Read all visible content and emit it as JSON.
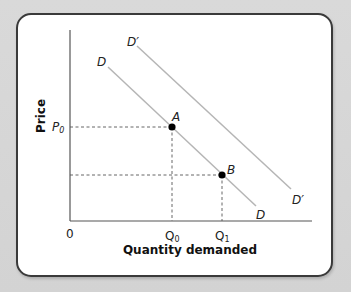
{
  "diagram": {
    "type": "economics-demand-shift",
    "axes": {
      "x_title": "Quantity demanded",
      "y_title": "Price",
      "origin_label": "0"
    },
    "curves": [
      {
        "name": "D",
        "label_start": "D",
        "label_end": "D",
        "color": "#b5b5b5"
      },
      {
        "name": "D'",
        "label_start": "D′",
        "label_end": "D′",
        "color": "#b5b5b5"
      }
    ],
    "points": [
      {
        "name": "A",
        "label": "A"
      },
      {
        "name": "B",
        "label": "B"
      }
    ],
    "ticks": {
      "x": [
        {
          "main": "Q",
          "sub": "0"
        },
        {
          "main": "Q",
          "sub": "1"
        }
      ],
      "y": [
        {
          "main": "P",
          "sub": "0"
        }
      ]
    },
    "colors": {
      "background": "#d7d7d7",
      "card": "#ffffff",
      "card_border": "#3a3a3a",
      "axis": "#555555",
      "curve": "#b5b5b5",
      "dashed": "#555555",
      "point": "#000000"
    }
  }
}
